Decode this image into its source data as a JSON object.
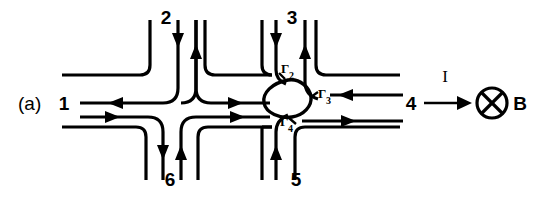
{
  "figure": {
    "panel_label": "(a)"
  },
  "terminals": [
    {
      "id": "t1",
      "label": "1",
      "position": "left",
      "x": 64,
      "y": 103
    },
    {
      "id": "t2",
      "label": "2",
      "position": "top-left",
      "x": 166,
      "y": 24
    },
    {
      "id": "t3",
      "label": "3",
      "position": "top-right",
      "x": 292,
      "y": 24
    },
    {
      "id": "t4",
      "label": "4",
      "position": "right",
      "x": 411,
      "y": 104
    },
    {
      "id": "t5",
      "label": "5",
      "position": "bottom-right",
      "x": 296,
      "y": 181
    },
    {
      "id": "t6",
      "label": "6",
      "position": "bottom-left",
      "x": 170,
      "y": 181
    }
  ],
  "antidot": {
    "name": "central-antidot-loop",
    "tunneling_labels": [
      {
        "id": "g2",
        "base": "Γ",
        "sub": "2",
        "x": 281,
        "y": 76
      },
      {
        "id": "g3",
        "base": "Γ",
        "sub": "3",
        "x": 319,
        "y": 101
      },
      {
        "id": "g4",
        "base": "Γ",
        "sub": "4",
        "x": 296,
        "y": 123
      }
    ]
  },
  "field": {
    "current_label": "I",
    "field_label": "B",
    "field_symbol": "circle-x-into-page"
  },
  "colors": {
    "ink": "#000000",
    "background": "#ffffff"
  }
}
